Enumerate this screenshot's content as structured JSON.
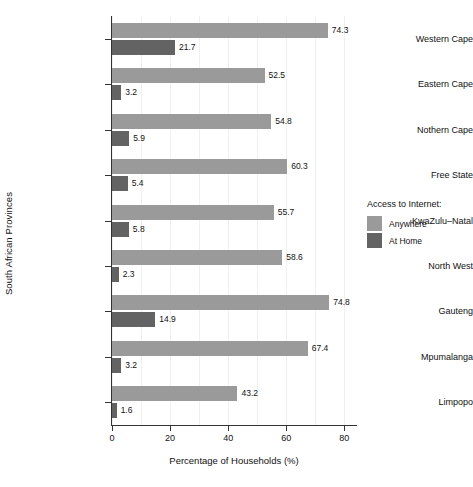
{
  "chart_data": {
    "type": "bar",
    "orientation": "horizontal",
    "title": "",
    "xlabel": "Percentage of Households (%)",
    "ylabel": "South African Provinces",
    "categories": [
      "Western Cape",
      "Eastern Cape",
      "Nothern Cape",
      "Free State",
      "KwaZulu–Natal",
      "North West",
      "Gauteng",
      "Mpumalanga",
      "Limpopo"
    ],
    "series": [
      {
        "name": "Anywhere",
        "color": "#9a9a9a",
        "values": [
          74.3,
          52.5,
          54.8,
          60.3,
          55.7,
          58.6,
          74.8,
          67.4,
          43.2
        ]
      },
      {
        "name": "At Home",
        "color": "#636363",
        "values": [
          21.7,
          3.2,
          5.9,
          5.4,
          5.8,
          2.3,
          14.9,
          3.2,
          1.6
        ]
      }
    ],
    "value_labels": {
      "Anywhere": [
        "74.3",
        "52.5",
        "54.8",
        "60.3",
        "55.7",
        "58.6",
        "74.8",
        "67.4",
        "43.2"
      ],
      "At Home": [
        "21.7",
        "3.2",
        "5.9",
        "5.4",
        "5.8",
        "2.3",
        "14.9",
        "3.2",
        "1.6"
      ]
    },
    "xlim": [
      0,
      84
    ],
    "xticks": [
      0,
      20,
      40,
      60,
      80
    ],
    "xtick_labels": [
      "0",
      "20",
      "40",
      "60",
      "80"
    ],
    "grid": "vertical-minor-light",
    "legend": {
      "title": "Access to Internet:",
      "position": "right",
      "entries": [
        {
          "label": "Anywhere",
          "color": "#9a9a9a"
        },
        {
          "label": "At Home",
          "color": "#636363"
        }
      ]
    }
  }
}
